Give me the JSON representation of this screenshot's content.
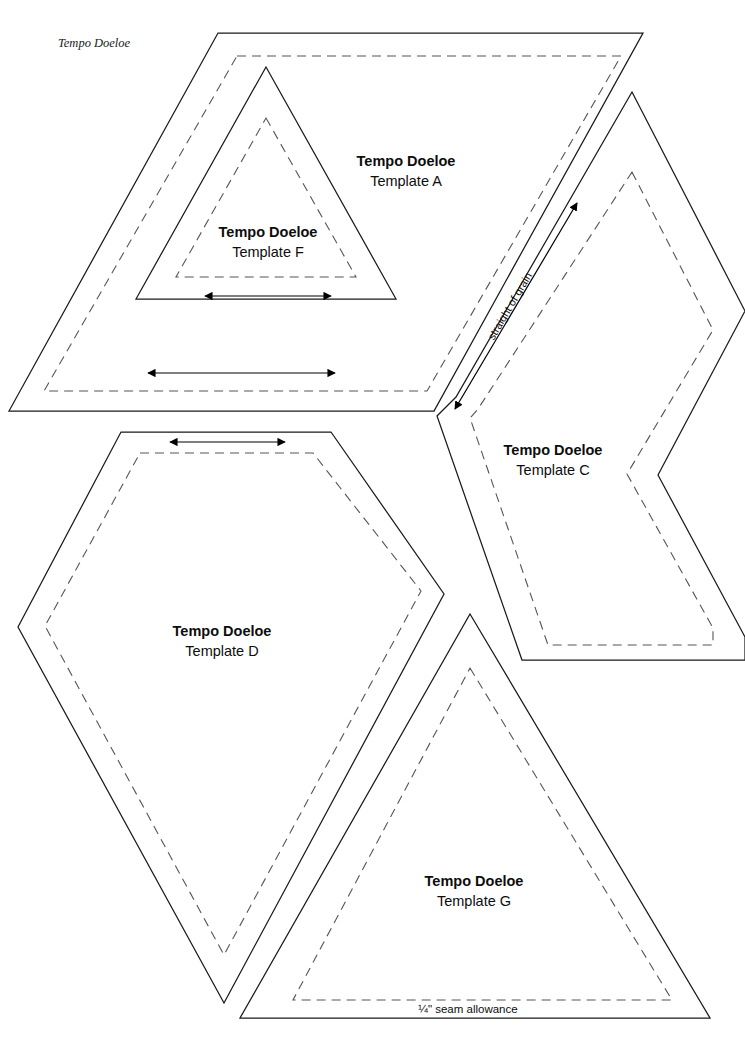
{
  "page": {
    "header_label": "Tempo Doeloe",
    "width": 745,
    "height": 1039,
    "background_color": "#ffffff",
    "cut_line_color": "#1a1a1a",
    "seam_line_color": "#555555",
    "seam_allowance_note": "¼\" seam allowance",
    "grain_note": "straight of grain"
  },
  "brand": "Tempo Doeloe",
  "templates": [
    {
      "id": "A",
      "brand": "Tempo Doeloe",
      "name": "Template A",
      "shape": "parallelogram",
      "label_x": 406,
      "label_y": 166,
      "label_y2": 186,
      "cut_points": "218,33 643,33 434,411 9,411",
      "seam_points": "237,56 621,56 427,391 44,391",
      "grain_arrow": {
        "x1": 148,
        "x2": 335,
        "y": 373
      }
    },
    {
      "id": "F",
      "brand": "Tempo Doeloe",
      "name": "Template F",
      "shape": "triangle",
      "label_x": 268,
      "label_y": 237,
      "label_y2": 257,
      "cut_points": "266,67 396,299 136,299",
      "seam_points": "266,118 356,277 176,277",
      "grain_arrow": {
        "x1": 205,
        "x2": 331,
        "y": 296
      }
    },
    {
      "id": "C",
      "brand": "Tempo Doeloe",
      "name": "Template C",
      "shape": "chevron",
      "label_x": 553,
      "label_y": 455,
      "label_y2": 475,
      "cut_points": "632,92 745,311 658,475 745,637 745,660 522,660 437,416 456,397",
      "seam_points": "632,172 713,330 627,474 713,628 713,645 548,645 470,418 478,409",
      "grain_line": {
        "x1": 455,
        "y1": 409,
        "x2": 577,
        "y2": 203
      },
      "grain_label_x": 513,
      "grain_label_y": 308
    },
    {
      "id": "D",
      "brand": "Tempo Doeloe",
      "name": "Template D",
      "shape": "hexagon-kite",
      "label_x": 222,
      "label_y": 636,
      "label_y2": 656,
      "cut_points": "121,432 331,432 444,594 224,1003 18,627",
      "seam_points": "140,453 313,453 421,591 224,955 45,626",
      "grain_arrow": {
        "x1": 170,
        "x2": 285,
        "y": 442
      }
    },
    {
      "id": "G",
      "brand": "Tempo Doeloe",
      "name": "Template G",
      "shape": "triangle",
      "label_x": 474,
      "label_y": 886,
      "label_y2": 906,
      "cut_points": "470,614 710,1018 240,1018",
      "seam_points": "470,668 672,1000 293,1000",
      "seam_label_x": 468,
      "seam_label_y": 1013
    }
  ]
}
